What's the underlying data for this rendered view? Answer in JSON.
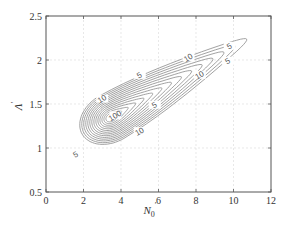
{
  "chart_data": {
    "type": "contour",
    "title": "",
    "xlabel": "N0'",
    "ylabel": "Λ'",
    "xlim": [
      0,
      12
    ],
    "ylim": [
      0.5,
      2.5
    ],
    "x_ticks": [
      0,
      2,
      4,
      6,
      8,
      10,
      12
    ],
    "y_ticks": [
      0.5,
      1,
      1.5,
      2,
      2.5
    ],
    "x_tick_labels": [
      "0",
      "2",
      "4",
      "6",
      "8",
      "10",
      "12"
    ],
    "y_tick_labels": [
      "0.5",
      "1",
      "1.5",
      "2",
      "2.5"
    ],
    "grid": true,
    "legend": null,
    "contour_levels_labeled": [
      5,
      10,
      100
    ],
    "peak": {
      "x": 3.5,
      "y": 1.35
    },
    "ridge_direction": "diagonal from (2, 0.85) to (10, 2.15)",
    "contour_labels": [
      {
        "text": "5",
        "x": 1.6,
        "y": 0.92
      },
      {
        "text": "10",
        "x": 3.0,
        "y": 1.55
      },
      {
        "text": "100",
        "x": 3.7,
        "y": 1.36
      },
      {
        "text": "10",
        "x": 5.0,
        "y": 1.18
      },
      {
        "text": "5",
        "x": 5.8,
        "y": 1.48
      },
      {
        "text": "5",
        "x": 5.0,
        "y": 1.82
      },
      {
        "text": "10",
        "x": 7.6,
        "y": 2.02
      },
      {
        "text": "10",
        "x": 8.2,
        "y": 1.82
      },
      {
        "text": "5",
        "x": 9.8,
        "y": 2.15
      },
      {
        "text": "5",
        "x": 9.7,
        "y": 1.98
      }
    ]
  },
  "axes": {
    "xlabel_main": "N",
    "xlabel_sub": "0",
    "xlabel_prime": "′",
    "ylabel_main": "Λ",
    "ylabel_prime": "′"
  }
}
